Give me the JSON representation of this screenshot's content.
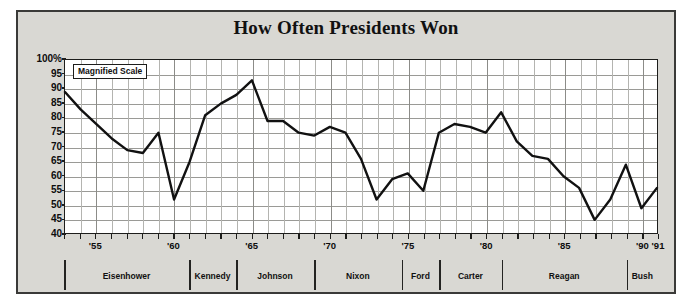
{
  "figure": {
    "title": "How Often Presidents Won",
    "annotation": "Magnified Scale"
  },
  "chart_data": {
    "type": "line",
    "title": "How Often Presidents Won",
    "xlabel": "",
    "ylabel": "",
    "xlim": [
      1953,
      1991
    ],
    "ylim": [
      40,
      100
    ],
    "grid": true,
    "legend": false,
    "annotations": [
      "Magnified Scale"
    ],
    "ytick_labels": [
      "100%",
      "95",
      "90",
      "85",
      "80",
      "75",
      "70",
      "65",
      "60",
      "55",
      "50",
      "45",
      "40"
    ],
    "ytick_values": [
      100,
      95,
      90,
      85,
      80,
      75,
      70,
      65,
      60,
      55,
      50,
      45,
      40
    ],
    "xtick_labels": [
      "'55",
      "'60",
      "'65",
      "'70",
      "'75",
      "'80",
      "'85",
      "'90",
      "'91"
    ],
    "xtick_values": [
      1955,
      1960,
      1965,
      1970,
      1975,
      1980,
      1985,
      1990,
      1991
    ],
    "x": [
      1953,
      1954,
      1955,
      1956,
      1957,
      1958,
      1959,
      1960,
      1961,
      1962,
      1963,
      1964,
      1965,
      1966,
      1967,
      1968,
      1969,
      1970,
      1971,
      1972,
      1973,
      1974,
      1975,
      1976,
      1977,
      1978,
      1979,
      1980,
      1981,
      1982,
      1983,
      1984,
      1985,
      1986,
      1987,
      1988,
      1989,
      1990,
      1991
    ],
    "values": [
      89,
      83,
      78,
      73,
      69,
      68,
      75,
      52,
      65,
      81,
      85,
      88,
      93,
      79,
      79,
      75,
      74,
      77,
      75,
      66,
      52,
      59,
      61,
      55,
      75,
      78,
      77,
      75,
      82,
      72,
      67,
      66,
      60,
      56,
      45,
      52,
      64,
      49,
      56
    ],
    "series": [
      {
        "name": "Presidential success rate",
        "color": "#111111",
        "values": [
          89,
          83,
          78,
          73,
          69,
          68,
          75,
          52,
          65,
          81,
          85,
          88,
          93,
          79,
          79,
          75,
          74,
          77,
          75,
          66,
          52,
          59,
          61,
          55,
          75,
          78,
          77,
          75,
          82,
          72,
          67,
          66,
          60,
          56,
          45,
          52,
          64,
          49,
          56
        ]
      }
    ],
    "president_bands": [
      {
        "name": "Eisenhower",
        "start": 1953,
        "end": 1961
      },
      {
        "name": "Kennedy",
        "start": 1961,
        "end": 1964
      },
      {
        "name": "Johnson",
        "start": 1964,
        "end": 1969
      },
      {
        "name": "Nixon",
        "start": 1969,
        "end": 1974.6
      },
      {
        "name": "Ford",
        "start": 1974.6,
        "end": 1977
      },
      {
        "name": "Carter",
        "start": 1977,
        "end": 1981
      },
      {
        "name": "Reagan",
        "start": 1981,
        "end": 1989
      },
      {
        "name": "Bush",
        "start": 1989,
        "end": 1991
      }
    ]
  }
}
